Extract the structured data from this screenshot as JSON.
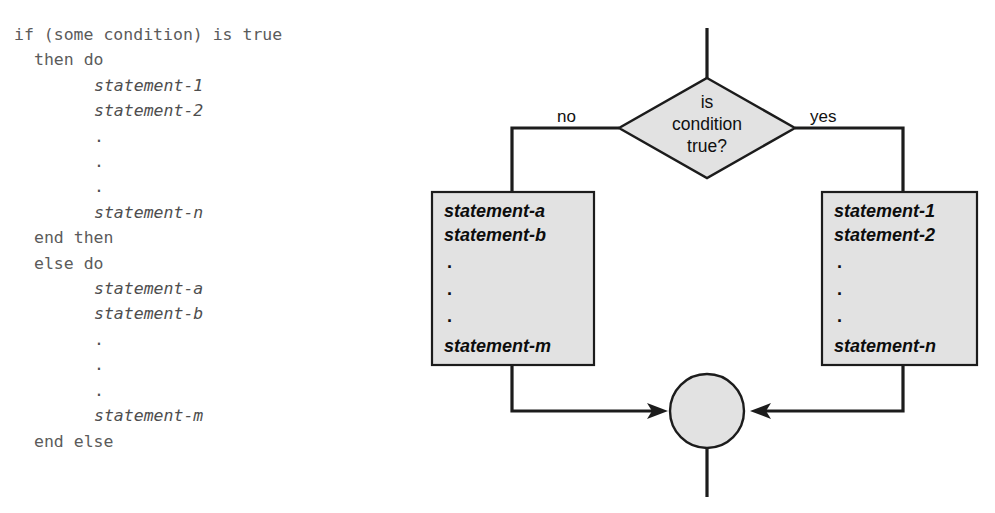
{
  "figure": {
    "type": "if-then-else-flowchart",
    "background_color": "#ffffff",
    "shape_fill_color": "#e2e2e2",
    "line_color": "#1c1c1c"
  },
  "pseudocode": {
    "lines": [
      {
        "text": "if (some condition) is true",
        "style": "kw",
        "indent": 0
      },
      {
        "text": "then do",
        "style": "kw",
        "indent": 2
      },
      {
        "text": "statement-1",
        "style": "stmt",
        "indent": 8
      },
      {
        "text": "statement-2",
        "style": "stmt",
        "indent": 8
      },
      {
        "text": ".",
        "style": "dot",
        "indent": 8
      },
      {
        "text": ".",
        "style": "dot",
        "indent": 8
      },
      {
        "text": ".",
        "style": "dot",
        "indent": 8
      },
      {
        "text": "statement-n",
        "style": "stmt",
        "indent": 8
      },
      {
        "text": "end then",
        "style": "kw",
        "indent": 2
      },
      {
        "text": "else do",
        "style": "kw",
        "indent": 2
      },
      {
        "text": "statement-a",
        "style": "stmt",
        "indent": 8
      },
      {
        "text": "statement-b",
        "style": "stmt",
        "indent": 8
      },
      {
        "text": ".",
        "style": "dot",
        "indent": 8
      },
      {
        "text": ".",
        "style": "dot",
        "indent": 8
      },
      {
        "text": ".",
        "style": "dot",
        "indent": 8
      },
      {
        "text": "statement-m",
        "style": "stmt",
        "indent": 8
      },
      {
        "text": "end else",
        "style": "kw",
        "indent": 2
      }
    ]
  },
  "flowchart": {
    "decision": {
      "lines": [
        "is",
        "condition",
        "true?"
      ]
    },
    "branch_labels": {
      "no": "no",
      "yes": "yes"
    },
    "false_box": {
      "lines": [
        "statement-a",
        "statement-b",
        ".",
        ".",
        ".",
        "statement-m"
      ]
    },
    "true_box": {
      "lines": [
        "statement-1",
        "statement-2",
        ".",
        ".",
        ".",
        "statement-n"
      ]
    },
    "join_node": {
      "label": ""
    }
  }
}
